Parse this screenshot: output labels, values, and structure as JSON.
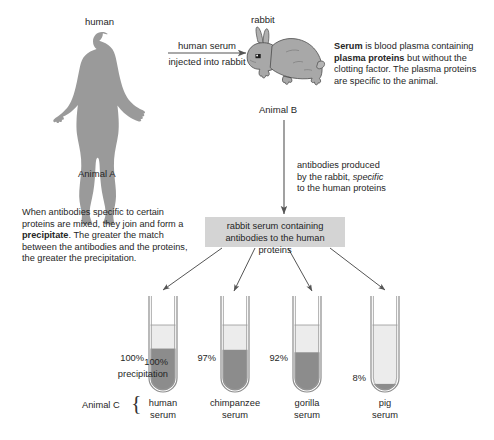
{
  "diagram": {
    "title_note": "Immunological precipitation test comparing species serum",
    "background": "#ffffff"
  },
  "top": {
    "human_label": "human",
    "animal_a_label": "Animal A",
    "rabbit_label": "rabbit",
    "animal_b_label": "Animal B",
    "injection_arrow": {
      "line1": "human serum",
      "line2": "injected into rabbit"
    },
    "serum_note": {
      "seg1_bold": "Serum",
      "seg2": " is blood plasma containing ",
      "seg3_bold": "plasma proteins",
      "seg4": " but without the clotting factor. The plasma proteins are specific to the animal."
    }
  },
  "middle": {
    "antibodies_note": {
      "line1": "antibodies produced",
      "line2_a": "by the rabbit, ",
      "line2_italic": "specific",
      "line3": "to the human proteins"
    },
    "precipitate_note": {
      "seg1": "When antibodies specific to certain proteins are mixed, they join and form a ",
      "seg2_bold": "precipitate",
      "seg3": ". The greater the match between the antibodies and the proteins, the greater the precipitation."
    },
    "serum_box": {
      "line1": "rabbit serum containing",
      "line2": "antibodies to the human proteins"
    }
  },
  "bottom": {
    "animal_c_label": "Animal C",
    "precipitation_caption": {
      "line1": "100%",
      "line2": "precipitation"
    },
    "tubes": [
      {
        "percent": "100%",
        "name_line1": "human",
        "name_line2": "serum",
        "fill_ratio": 0.62
      },
      {
        "percent": "97%",
        "name_line1": "chimpanzee",
        "name_line2": "serum",
        "fill_ratio": 0.6
      },
      {
        "percent": "92%",
        "name_line1": "gorilla",
        "name_line2": "serum",
        "fill_ratio": 0.56
      },
      {
        "percent": "8%",
        "name_line1": "pig",
        "name_line2": "serum",
        "fill_ratio": 0.05
      }
    ]
  },
  "colors": {
    "silhouette": "#9a9a9a",
    "rabbit_body": "#a8a8a8",
    "precipitate": "#8c8c8c",
    "liquid": "#ececec",
    "box_fill": "#d4d4d4",
    "line": "#555555",
    "text": "#262626"
  },
  "icons": {
    "human": "human-silhouette-icon",
    "rabbit": "rabbit-icon",
    "arrow": "arrow-icon",
    "brace": "curly-brace-icon",
    "tube": "test-tube-icon"
  }
}
